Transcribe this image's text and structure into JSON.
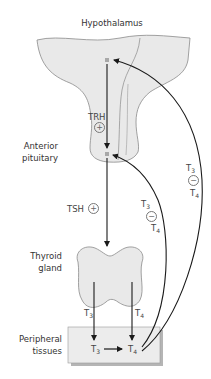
{
  "title": "Hypothalamus",
  "organs": {
    "hypothalamus": "Hypothalamus",
    "anterior_pituitary": [
      "Anterior",
      "pituitary"
    ],
    "thyroid": [
      "Thyroid",
      "gland"
    ],
    "peripheral": [
      "Peripheral",
      "tissues"
    ]
  },
  "hormones": {
    "trh": "TRH",
    "tsh": "TSH",
    "t3": "T",
    "t4": "T",
    "sub3": "3",
    "sub4": "4"
  },
  "signs": {
    "plus": "+",
    "minus": "−"
  },
  "colors": {
    "organ_fill": "#e9e9e9",
    "organ_stroke": "#8a8a8a",
    "arrow": "#1a1a1a",
    "box_fill": "#ececec",
    "box_shadow": "#b5b5b5",
    "marker": "#a8a8a8"
  }
}
